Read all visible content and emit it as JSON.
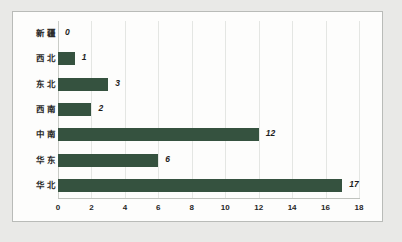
{
  "chart_data": {
    "type": "bar",
    "orientation": "horizontal",
    "title": "",
    "subtitle": "",
    "xlabel": "",
    "ylabel": "",
    "categories": [
      "新疆",
      "西北",
      "东北",
      "西南",
      "中南",
      "华东",
      "华北"
    ],
    "values": [
      0,
      1,
      3,
      2,
      12,
      6,
      17
    ],
    "value_labels": [
      "0",
      "1",
      "3",
      "2",
      "12",
      "6",
      "17"
    ],
    "xlim": [
      0,
      18
    ],
    "xticks": [
      0,
      2,
      4,
      6,
      8,
      10,
      12,
      14,
      16,
      18
    ],
    "xtick_labels": [
      "0",
      "2",
      "4",
      "6",
      "8",
      "10",
      "12",
      "14",
      "16",
      "18"
    ],
    "grid": "vertical",
    "legend": "none",
    "bar_color": "#35523f",
    "plot_background": "#fdfdfc",
    "frame_color": "#b9bbb8",
    "page_background": "#e9e9e7"
  }
}
